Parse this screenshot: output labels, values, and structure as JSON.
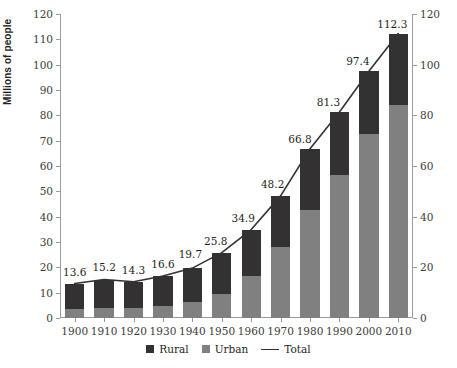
{
  "chart_data": {
    "type": "bar",
    "subtype": "stacked-bar-with-line",
    "title": "",
    "xlabel": "",
    "ylabel": "Millions of people",
    "ylim": [
      0,
      120
    ],
    "ylim_right": [
      0,
      120
    ],
    "yticks": [
      0,
      10,
      20,
      30,
      40,
      50,
      60,
      70,
      80,
      90,
      100,
      110,
      120
    ],
    "yticks_right": [
      0,
      20,
      40,
      60,
      80,
      100,
      120
    ],
    "grid": false,
    "legend_position": "bottom-center",
    "categories": [
      "1900",
      "1910",
      "1920",
      "1930",
      "1940",
      "1950",
      "1960",
      "1970",
      "1980",
      "1990",
      "2000",
      "2010"
    ],
    "series": [
      {
        "name": "Urban",
        "color": "#808080",
        "values": [
          3.4,
          3.9,
          4.1,
          4.9,
          6.5,
          9.5,
          16.5,
          28.0,
          42.5,
          56.5,
          72.5,
          84.0
        ]
      },
      {
        "name": "Rural",
        "color": "#333132",
        "values": [
          10.2,
          11.3,
          10.2,
          11.7,
          13.2,
          16.3,
          18.4,
          20.2,
          24.3,
          24.8,
          24.9,
          28.3
        ]
      },
      {
        "name": "Total",
        "color": "#333132",
        "type": "line",
        "values": [
          13.6,
          15.2,
          14.3,
          16.6,
          19.7,
          25.8,
          34.9,
          48.2,
          66.8,
          81.3,
          97.4,
          112.3
        ]
      }
    ],
    "data_labels": [
      "13.6",
      "15.2",
      "14.3",
      "16.6",
      "19.7",
      "25.8",
      "34.9",
      "48.2",
      "66.8",
      "81.3",
      "97.4",
      "112.3"
    ],
    "legend": [
      {
        "label": "Rural",
        "marker": "square",
        "color": "#333132"
      },
      {
        "label": "Urban",
        "marker": "square",
        "color": "#808080"
      },
      {
        "label": "Total",
        "marker": "line",
        "color": "#333132"
      }
    ]
  }
}
